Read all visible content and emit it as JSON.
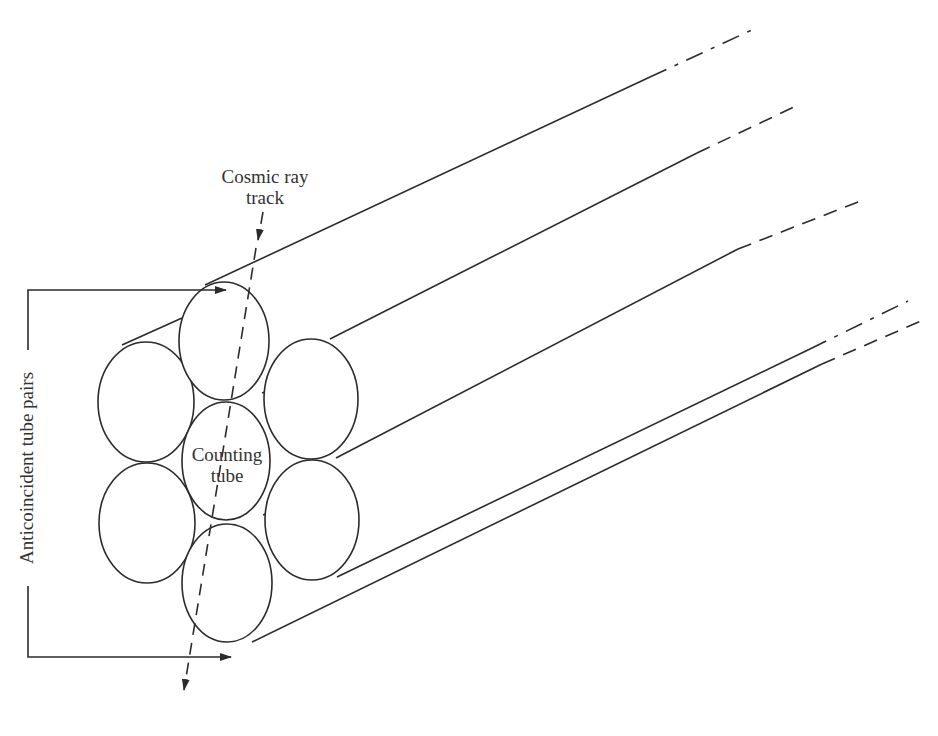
{
  "diagram": {
    "labels": {
      "cosmic_ray_line1": "Cosmic ray",
      "cosmic_ray_line2": "track",
      "counting_line1": "Counting",
      "counting_line2": "tube",
      "anticoincident": "Anticoincident tube pairs"
    },
    "tubes": [
      {
        "name": "top",
        "role": "anticoincident"
      },
      {
        "name": "upper-left",
        "role": "anticoincident"
      },
      {
        "name": "upper-right",
        "role": "anticoincident"
      },
      {
        "name": "center",
        "role": "counting"
      },
      {
        "name": "lower-left",
        "role": "anticoincident"
      },
      {
        "name": "lower-right",
        "role": "anticoincident"
      },
      {
        "name": "bottom",
        "role": "anticoincident"
      }
    ],
    "colors": {
      "ink": "#2b2b2b",
      "background": "#ffffff"
    }
  }
}
